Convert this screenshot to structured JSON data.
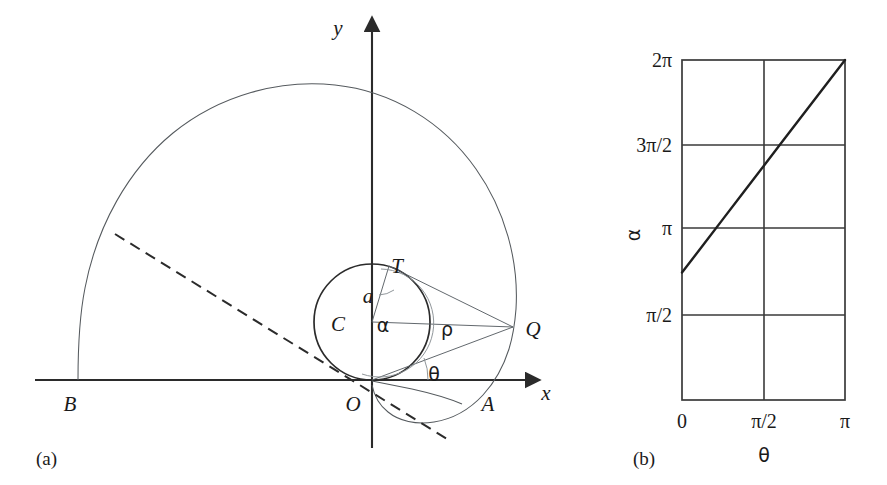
{
  "figure": {
    "panels": [
      {
        "id": "a",
        "caption": "(a)",
        "axis_labels": {
          "x": "x",
          "y": "y"
        },
        "point_labels": {
          "origin": "O",
          "left_end": "B",
          "right_end": "A",
          "tangent_point": "T",
          "circle_center": "C",
          "curve_point": "Q"
        },
        "measure_labels": {
          "radius": "a",
          "polar_radius": "ρ",
          "center_angle": "α",
          "polar_angle": "θ"
        }
      },
      {
        "id": "b",
        "caption": "(b)",
        "axis_labels": {
          "x": "θ",
          "y": "α"
        },
        "x_ticks": [
          "0",
          "π/2",
          "π"
        ],
        "y_ticks": [
          "π/2",
          "π",
          "3π/2",
          "2π"
        ]
      }
    ]
  },
  "chart_data": {
    "type": "line",
    "title": "",
    "xlabel": "θ",
    "ylabel": "α",
    "xlim": [
      0,
      3.14159
    ],
    "ylim": [
      0,
      6.28319
    ],
    "xtick_labels": [
      "0",
      "π/2",
      "π"
    ],
    "xtick_values": [
      0,
      1.5708,
      3.14159
    ],
    "ytick_labels": [
      "π/2",
      "π",
      "3π/2",
      "2π"
    ],
    "ytick_values": [
      1.5708,
      3.14159,
      4.71239,
      6.28319
    ],
    "grid": true,
    "legend": "none",
    "series": [
      {
        "name": "α(θ)",
        "x": [
          0,
          0.3927,
          0.7854,
          1.1781,
          1.5708,
          1.9635,
          2.3562,
          2.7489,
          3.14159
        ],
        "y": [
          2.3562,
          2.8452,
          3.3379,
          3.8306,
          4.3197,
          4.8124,
          5.3051,
          5.7941,
          6.28319
        ]
      }
    ],
    "annotations": [
      {
        "text": "line passes from (0, 3π/4) to (π, 2π)"
      }
    ]
  },
  "geometry": {
    "panel_a": {
      "origin_px": [
        372,
        380
      ],
      "circle_center_px": [
        372,
        322
      ],
      "circle_radius_px": 58,
      "q_point_px": [
        513,
        327
      ],
      "a_point_px": [
        488,
        380
      ],
      "b_point_px": [
        78,
        380
      ],
      "t_point_px": [
        389,
        268
      ]
    },
    "panel_b": {
      "plot_left_px": 682,
      "plot_right_px": 845,
      "plot_top_px": 60,
      "plot_bottom_px": 400,
      "vgrid_px": [
        764
      ],
      "hgrid_px": [
        145,
        228,
        315
      ]
    }
  }
}
